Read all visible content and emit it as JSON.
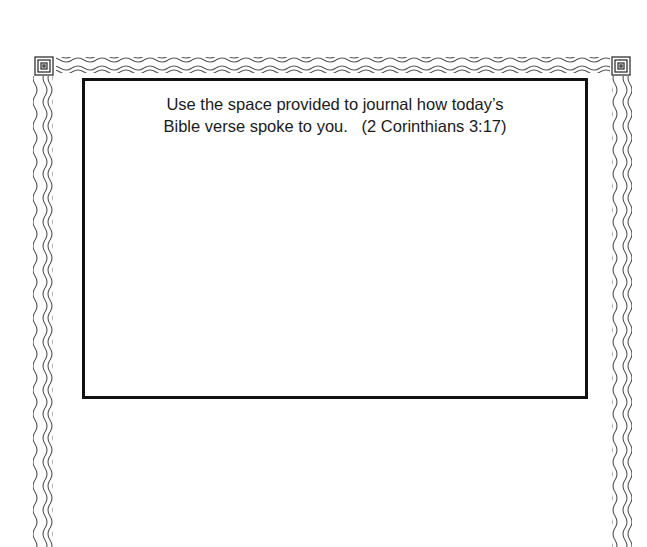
{
  "page": {
    "type": "journal-worksheet",
    "border_style": "wavy-lines-with-spiral-corners",
    "colors": {
      "border": "#4a4a4a",
      "box_stroke": "#111111",
      "text": "#1a1a1a",
      "background": "#ffffff"
    }
  },
  "journal_box": {
    "prompt_line_1": "Use the space provided to journal how today’s",
    "prompt_line_2_main": "Bible verse spoke to you.",
    "prompt_reference": "(2 Corinthians 3:17)"
  }
}
